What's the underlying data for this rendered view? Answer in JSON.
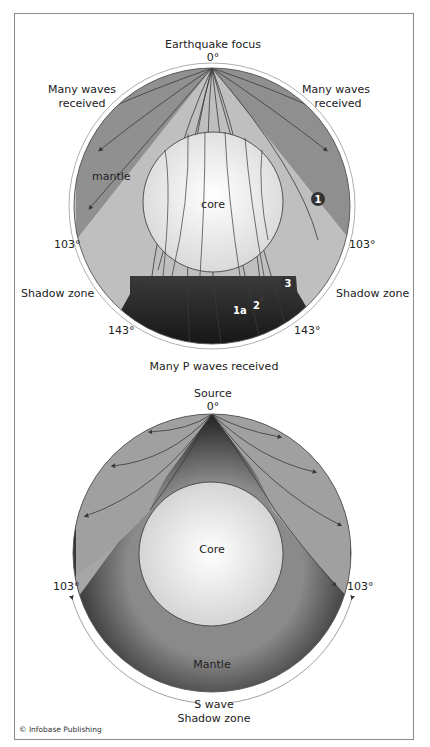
{
  "figure": {
    "credit": "© Infobase Publishing",
    "colors": {
      "mantle_dark": "#8e8e8e",
      "mantle_light": "#bdbdbd",
      "core": "#f2f2f2",
      "shadow_dark": "#1e1e1e",
      "ray": "#3a3a3a",
      "outline": "#444444"
    }
  },
  "p_wave_diagram": {
    "focus_label": "Earthquake focus",
    "focus_angle": "0°",
    "left_received": [
      "Many waves",
      "received"
    ],
    "right_received": [
      "Many waves",
      "received"
    ],
    "mantle_label": "mantle",
    "core_label": "core",
    "left_103": "103°",
    "right_103": "103°",
    "left_shadow": "Shadow zone",
    "right_shadow": "Shadow zone",
    "left_143": "143°",
    "right_143": "143°",
    "bottom_label": "Many P waves received",
    "markers": [
      "1",
      "3"
    ],
    "path_labels": [
      "1a",
      "2"
    ]
  },
  "s_wave_diagram": {
    "source_label": "Source",
    "source_angle": "0°",
    "core_label": "Core",
    "mantle_label": "Mantle",
    "left_103": "103°",
    "right_103": "103°",
    "shadow_label": [
      "S wave",
      "Shadow zone"
    ]
  }
}
